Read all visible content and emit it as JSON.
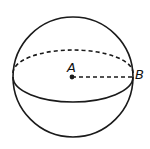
{
  "diagram": {
    "type": "sphere",
    "labels": {
      "center": "A",
      "surface_point": "B"
    },
    "stroke_color": "#1a1a1a",
    "background": "#ffffff"
  }
}
